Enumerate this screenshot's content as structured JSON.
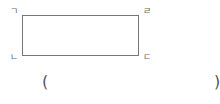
{
  "figure": {
    "shape": "rectangle",
    "vertices": {
      "top_left": "ㄱ",
      "top_right": "ㄹ",
      "bottom_left": "ㄴ",
      "bottom_right": "ㄷ"
    }
  },
  "answer": {
    "open_paren": "(",
    "close_paren": ")",
    "value": ""
  }
}
